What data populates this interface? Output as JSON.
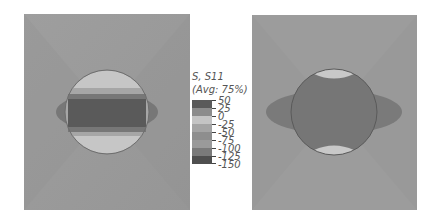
{
  "figure": {
    "left_panel": {
      "description": "Contour plot with circular inclusion and horizontal dark band"
    },
    "right_panel": {
      "description": "Contour plot with dark circular inclusion and elliptical lobes"
    },
    "legend": {
      "title": "S, S11",
      "subtitle": "(Avg: 75%)",
      "ticks": [
        "50",
        "25",
        "0",
        "-25",
        "-50",
        "-75",
        "-100",
        "-125",
        "-150"
      ],
      "band_colors": [
        "#5a5a5a",
        "#8c8c8c",
        "#c4c4c4",
        "#a4a4a4",
        "#8e8e8e",
        "#9a9a9a",
        "#7a7a7a",
        "#4f4f4f"
      ]
    },
    "colors": {
      "background_field": "#9a9a9a",
      "dark_region": "#6a6a6a",
      "darker_band": "#555555",
      "light_cap": "#c9c9c9"
    }
  }
}
